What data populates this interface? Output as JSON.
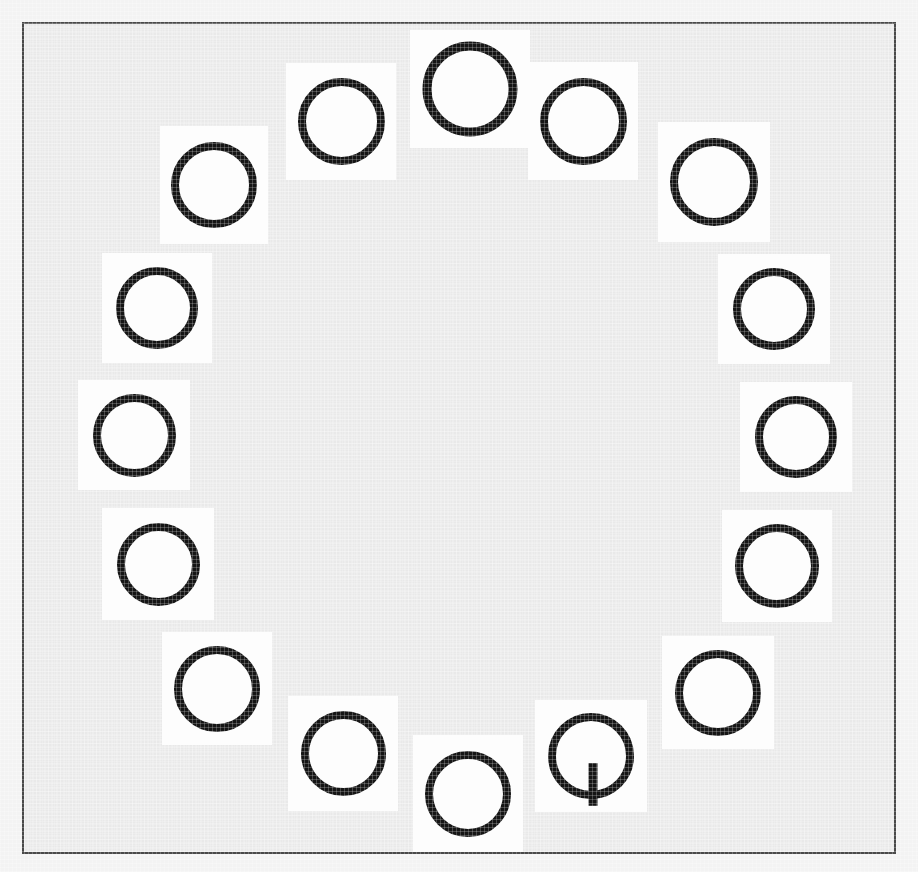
{
  "scene": {
    "title": "Visual search array",
    "description": "Ring of letter stimuli on white tiles over a gray canvas",
    "width": 918,
    "height": 872,
    "outer_background_color": "#f3f3f3",
    "canvas_background_color": "#e9e9e9",
    "canvas_border_color": "#4a4a4a",
    "canvas_border_width": 2,
    "tile_color": "#fdfdfd",
    "glyph_color": "#151515",
    "item_count": 16,
    "distractor_letter": "O",
    "distractor_count": 15,
    "target_letter": "Q",
    "target_count": 1,
    "target_index": 12,
    "layout": "ring"
  },
  "items": [
    {
      "letter": "O",
      "tile_x": 410,
      "tile_y": 30,
      "tile_w": 120,
      "tile_h": 118,
      "glyph_w": 86,
      "glyph_h": 86,
      "stroke": 9,
      "position": "top"
    },
    {
      "letter": "O",
      "tile_x": 286,
      "tile_y": 63,
      "tile_w": 110,
      "tile_h": 117,
      "glyph_w": 79,
      "glyph_h": 79,
      "stroke": 8,
      "position": "top-left-1"
    },
    {
      "letter": "O",
      "tile_x": 160,
      "tile_y": 126,
      "tile_w": 108,
      "tile_h": 118,
      "glyph_w": 78,
      "glyph_h": 78,
      "stroke": 8,
      "position": "upper-left"
    },
    {
      "letter": "O",
      "tile_x": 102,
      "tile_y": 253,
      "tile_w": 110,
      "tile_h": 110,
      "glyph_w": 74,
      "glyph_h": 74,
      "stroke": 8,
      "position": "left-upper"
    },
    {
      "letter": "O",
      "tile_x": 78,
      "tile_y": 380,
      "tile_w": 112,
      "tile_h": 110,
      "glyph_w": 75,
      "glyph_h": 75,
      "stroke": 8,
      "position": "left"
    },
    {
      "letter": "O",
      "tile_x": 102,
      "tile_y": 508,
      "tile_w": 112,
      "tile_h": 112,
      "glyph_w": 75,
      "glyph_h": 75,
      "stroke": 8,
      "position": "left-lower"
    },
    {
      "letter": "O",
      "tile_x": 162,
      "tile_y": 632,
      "tile_w": 110,
      "tile_h": 113,
      "glyph_w": 78,
      "glyph_h": 78,
      "stroke": 8,
      "position": "lower-left"
    },
    {
      "letter": "O",
      "tile_x": 288,
      "tile_y": 696,
      "tile_w": 110,
      "tile_h": 115,
      "glyph_w": 77,
      "glyph_h": 77,
      "stroke": 8,
      "position": "bottom-left-1"
    },
    {
      "letter": "O",
      "tile_x": 413,
      "tile_y": 735,
      "tile_w": 110,
      "tile_h": 117,
      "glyph_w": 78,
      "glyph_h": 78,
      "stroke": 8,
      "position": "bottom"
    },
    {
      "letter": "Q",
      "tile_x": 535,
      "tile_y": 700,
      "tile_w": 112,
      "tile_h": 112,
      "glyph_w": 78,
      "glyph_h": 78,
      "stroke": 8,
      "position": "bottom-right-1"
    },
    {
      "letter": "O",
      "tile_x": 662,
      "tile_y": 636,
      "tile_w": 112,
      "tile_h": 113,
      "glyph_w": 78,
      "glyph_h": 78,
      "stroke": 8,
      "position": "lower-right"
    },
    {
      "letter": "O",
      "tile_x": 722,
      "tile_y": 510,
      "tile_w": 110,
      "tile_h": 112,
      "glyph_w": 76,
      "glyph_h": 76,
      "stroke": 8,
      "position": "right-lower"
    },
    {
      "letter": "O",
      "tile_x": 740,
      "tile_y": 382,
      "tile_w": 112,
      "tile_h": 110,
      "glyph_w": 74,
      "glyph_h": 74,
      "stroke": 8,
      "position": "right"
    },
    {
      "letter": "O",
      "tile_x": 718,
      "tile_y": 254,
      "tile_w": 112,
      "tile_h": 110,
      "glyph_w": 74,
      "glyph_h": 74,
      "stroke": 8,
      "position": "right-upper"
    },
    {
      "letter": "O",
      "tile_x": 658,
      "tile_y": 122,
      "tile_w": 112,
      "tile_h": 120,
      "glyph_w": 80,
      "glyph_h": 80,
      "stroke": 8,
      "position": "upper-right"
    },
    {
      "letter": "O",
      "tile_x": 528,
      "tile_y": 62,
      "tile_w": 110,
      "tile_h": 118,
      "glyph_w": 79,
      "glyph_h": 79,
      "stroke": 8,
      "position": "top-right-1"
    }
  ]
}
